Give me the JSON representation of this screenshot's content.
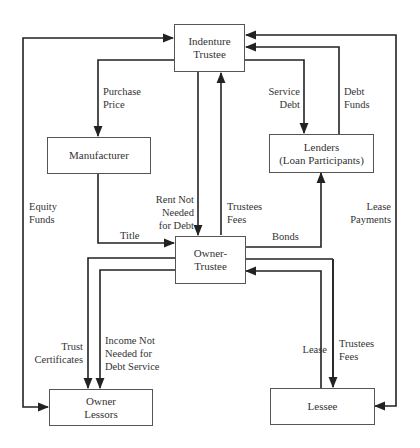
{
  "diagram": {
    "type": "flow",
    "nodes": [
      {
        "id": "indenture_trustee",
        "lines": [
          "Indenture",
          "Trustee"
        ]
      },
      {
        "id": "manufacturer",
        "lines": [
          "Manufacturer"
        ]
      },
      {
        "id": "lenders",
        "lines": [
          "Lenders",
          "(Loan Participants)"
        ]
      },
      {
        "id": "owner_trustee",
        "lines": [
          "Owner-",
          "Trustee"
        ]
      },
      {
        "id": "owner_lessors",
        "lines": [
          "Owner",
          "Lessors"
        ]
      },
      {
        "id": "lessee",
        "lines": [
          "Lessee"
        ]
      }
    ],
    "edges": [
      {
        "id": "purchase_price",
        "lines": [
          "Purchase",
          "Price"
        ],
        "from": "indenture_trustee",
        "to": "manufacturer"
      },
      {
        "id": "service_debt",
        "lines": [
          "Service",
          "Debt"
        ],
        "from": "indenture_trustee",
        "to": "lenders"
      },
      {
        "id": "debt_funds",
        "lines": [
          "Debt",
          "Funds"
        ],
        "from": "lenders",
        "to": "indenture_trustee"
      },
      {
        "id": "equity_funds",
        "lines": [
          "Equity",
          "Funds"
        ],
        "from": "owner_lessors",
        "to": "indenture_trustee"
      },
      {
        "id": "lease_payments",
        "lines": [
          "Lease",
          "Payments"
        ],
        "from": "lessee",
        "to": "indenture_trustee"
      },
      {
        "id": "rent_not_needed",
        "lines": [
          "Rent Not",
          "Needed",
          "for Debt"
        ],
        "from": "indenture_trustee",
        "to": "owner_trustee"
      },
      {
        "id": "trustees_fees_top",
        "lines": [
          "Trustees",
          "Fees"
        ],
        "from": "owner_trustee",
        "to": "indenture_trustee"
      },
      {
        "id": "title",
        "lines": [
          "Title"
        ],
        "from": "manufacturer",
        "to": "owner_trustee"
      },
      {
        "id": "bonds",
        "lines": [
          "Bonds"
        ],
        "from": "owner_trustee",
        "to": "lenders"
      },
      {
        "id": "trust_certificates",
        "lines": [
          "Trust",
          "Certificates"
        ],
        "from": "owner_trustee",
        "to": "owner_lessors"
      },
      {
        "id": "income_not_needed",
        "lines": [
          "Income Not",
          "Needed for",
          "Debt Service"
        ],
        "from": "owner_trustee",
        "to": "owner_lessors"
      },
      {
        "id": "lease",
        "lines": [
          "Lease"
        ],
        "from": "owner_trustee",
        "to": "lessee"
      },
      {
        "id": "trustees_fees_bottom",
        "lines": [
          "Trustees",
          "Fees"
        ],
        "from": "lessee",
        "to": "owner_trustee"
      }
    ]
  }
}
